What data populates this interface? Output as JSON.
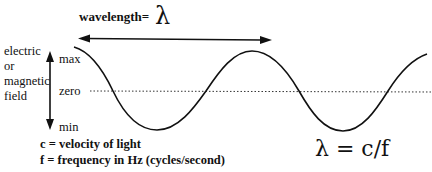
{
  "diagram": {
    "wavelength_label": "wavelength=",
    "wavelength_symbol": "λ",
    "y_axis_label_lines": [
      "electric",
      "or",
      "magnetic",
      "field"
    ],
    "y_ticks": {
      "max": "max",
      "zero": "zero",
      "min": "min"
    },
    "legend": [
      "c = velocity of light",
      "f = frequency in Hz (cycles/second)"
    ],
    "formula": "λ = c/f",
    "colors": {
      "ink": "#111111",
      "background": "#ffffff"
    },
    "elements": {
      "wave": "sine wave, approx. two wavelengths",
      "zero_line": "dotted horizontal line",
      "wavelength_arrow": "double-headed horizontal arrow spanning one wavelength",
      "amplitude_arrow": "double-headed vertical arrow from max to min"
    }
  }
}
